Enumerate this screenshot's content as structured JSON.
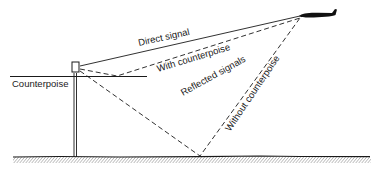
{
  "diagram": {
    "labels": {
      "counterpoise": "Counterpoise",
      "direct_signal": "Direct signal",
      "with_counterpoise": "With counterpoise",
      "reflected_signals": "Reflected signals",
      "without_counterpoise": "Without counterpoise"
    },
    "icons": {
      "aircraft": "airplane-silhouette",
      "antenna": "antenna-box"
    },
    "colors": {
      "line": "#1a1a1a",
      "background": "#ffffff"
    }
  }
}
